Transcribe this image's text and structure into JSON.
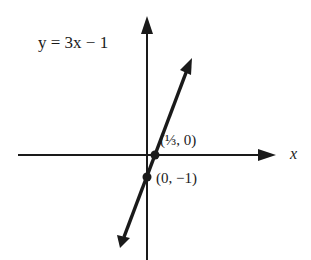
{
  "equation_label": "y = 3x − 1",
  "x_axis_label": "x",
  "points": [
    {
      "label": "(1/3, 0)",
      "display": "(⅓, 0)"
    },
    {
      "label": "(0, −1)",
      "display": "(0, −1)"
    }
  ],
  "colors": {
    "ink": "#1a1a1a",
    "background": "#ffffff"
  }
}
